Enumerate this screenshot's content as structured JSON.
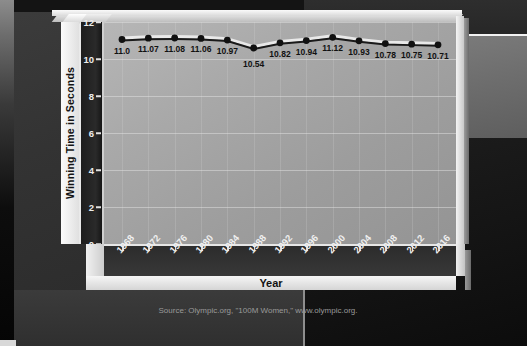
{
  "chart_data": {
    "type": "line",
    "title": "",
    "xlabel": "Year",
    "ylabel": "Winning Time in Seconds",
    "categories": [
      "1968",
      "1972",
      "1976",
      "1980",
      "1984",
      "1988",
      "1992",
      "1996",
      "2000",
      "2004",
      "2008",
      "2012",
      "2016"
    ],
    "values": [
      11.0,
      11.07,
      11.08,
      11.06,
      10.97,
      10.54,
      10.82,
      10.94,
      11.12,
      10.93,
      10.78,
      10.75,
      10.71
    ],
    "data_labels": [
      "11.0",
      "11.07",
      "11.08",
      "11.06",
      "10.97",
      "10.54",
      "10.82",
      "10.94",
      "11.12",
      "10.93",
      "10.78",
      "10.75",
      "10.71"
    ],
    "ylim": [
      0,
      12
    ],
    "ytick_labels": [
      "0",
      "2",
      "4",
      "6",
      "8",
      "10",
      "12"
    ],
    "ytick_values": [
      0,
      2,
      4,
      6,
      8,
      10,
      12
    ],
    "grid": true,
    "legend": false,
    "legend_position": "none",
    "style": "3d",
    "series": [
      {
        "name": "Winning Time",
        "values": [
          11.0,
          11.07,
          11.08,
          11.06,
          10.97,
          10.54,
          10.82,
          10.94,
          11.12,
          10.93,
          10.78,
          10.75,
          10.71
        ]
      }
    ]
  },
  "axes": {
    "y_title": "Winning Time in Seconds",
    "x_title": "Year"
  },
  "source": {
    "text": "Source: Olympic.org, \"100M Women,\" www.olympic.org."
  },
  "colors": {
    "plot_background": "#a9a9a9",
    "axis_block": "#2a2a2a",
    "frame_light": "#f0f0f0",
    "line": "#1a1a1a",
    "line_highlight": "#e9e9e9",
    "marker": "#111111",
    "tick_text": "#f0f0f0",
    "label_text": "#111111",
    "source_text": "#9a9a9a",
    "page_background": "#1b1b1b"
  }
}
